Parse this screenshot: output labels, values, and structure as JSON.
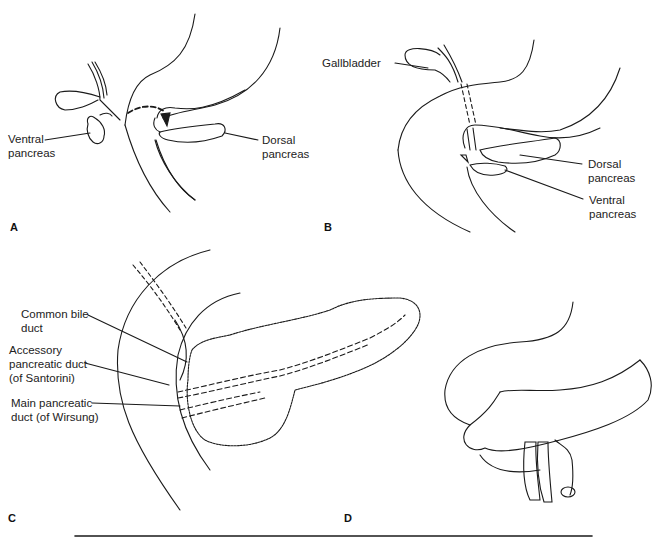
{
  "figure": {
    "panels": [
      {
        "id": "A",
        "letter": "A",
        "labels": {
          "ventral": "Ventral\npancreas",
          "dorsal": "Dorsal\npancreas"
        }
      },
      {
        "id": "B",
        "letter": "B",
        "labels": {
          "gallbladder": "Gallbladder",
          "dorsal": "Dorsal\npancreas",
          "ventral": "Ventral\npancreas"
        }
      },
      {
        "id": "C",
        "letter": "C",
        "labels": {
          "common_bile_duct": "Common bile\nduct",
          "accessory_duct": "Accessory\npancreatic duct\n(of Santorini)",
          "main_duct": "Main pancreatic\nduct (of Wirsung)"
        }
      },
      {
        "id": "D",
        "letter": "D",
        "labels": {}
      }
    ],
    "colors": {
      "line": "#1a1a1a",
      "background": "#ffffff"
    }
  }
}
